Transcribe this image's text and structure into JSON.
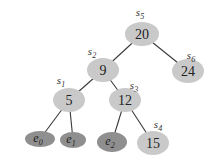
{
  "tree": {
    "nodes": [
      {
        "id": "s5",
        "type": "internal",
        "key": "20",
        "name": "s",
        "name_sub": "5"
      },
      {
        "id": "s2",
        "type": "internal",
        "key": "9",
        "name": "s",
        "name_sub": "2"
      },
      {
        "id": "s6",
        "type": "internal",
        "key": "24",
        "name": "s",
        "name_sub": "6"
      },
      {
        "id": "s1",
        "type": "internal",
        "key": "5",
        "name": "s",
        "name_sub": "1"
      },
      {
        "id": "s3",
        "type": "internal",
        "key": "12",
        "name": "s",
        "name_sub": "3"
      },
      {
        "id": "e0",
        "type": "leaf",
        "label": "e",
        "label_sub": "0"
      },
      {
        "id": "e1",
        "type": "leaf",
        "label": "e",
        "label_sub": "1"
      },
      {
        "id": "e2",
        "type": "leaf",
        "label": "e",
        "label_sub": "2"
      },
      {
        "id": "s4",
        "type": "internal",
        "key": "15",
        "name": "s",
        "name_sub": "4"
      }
    ],
    "edges": [
      [
        "s5",
        "s2"
      ],
      [
        "s5",
        "s6"
      ],
      [
        "s2",
        "s1"
      ],
      [
        "s2",
        "s3"
      ],
      [
        "s1",
        "e0"
      ],
      [
        "s1",
        "e1"
      ],
      [
        "s3",
        "e2"
      ],
      [
        "s3",
        "s4"
      ]
    ],
    "colors": {
      "internal": "#c9c9c9",
      "leaf": "#8f8f8f",
      "edge": "#3a3a3a"
    }
  }
}
